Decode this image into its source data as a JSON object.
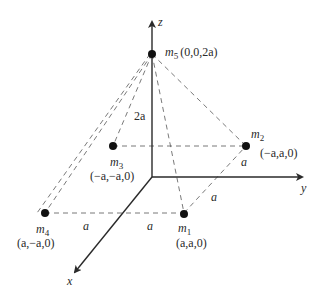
{
  "diagram": {
    "axes": {
      "x": {
        "label": "x"
      },
      "y": {
        "label": "y"
      },
      "z": {
        "label": "z"
      }
    },
    "masses": [
      {
        "id": "m1",
        "name": "m",
        "sub": "1",
        "coords": "(a,a,0)"
      },
      {
        "id": "m2",
        "name": "m",
        "sub": "2",
        "coords": "(−a,a,0)"
      },
      {
        "id": "m3",
        "name": "m",
        "sub": "3",
        "coords": "(−a,−a,0)"
      },
      {
        "id": "m4",
        "name": "m",
        "sub": "4",
        "coords": "(a,−a,0)"
      },
      {
        "id": "m5",
        "name": "m",
        "sub": "5",
        "coords": "(0,0,2a)"
      }
    ],
    "dimension_labels": {
      "height": "2a",
      "m4_m1_left": "a",
      "m4_m1_right": "a",
      "m2_side_upper": "a",
      "m2_side_lower": "a"
    },
    "colors": {
      "ink": "#2a2a2a",
      "dash": "#6a6a6a",
      "point": "#111111",
      "background": "#ffffff"
    }
  }
}
